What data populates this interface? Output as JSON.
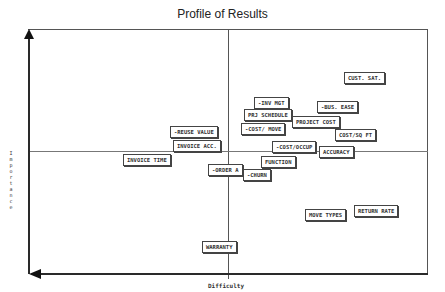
{
  "chart_data": {
    "type": "scatter",
    "title": "Profile of Results",
    "xlabel": "Difficulty",
    "ylabel": "Importance",
    "grid": "quadrant midlines",
    "legend": "none",
    "points": [
      {
        "label": "CUST. SAT.",
        "x": 344,
        "y": 72
      },
      {
        "label": "-INV MGT",
        "x": 254,
        "y": 97
      },
      {
        "label": "-BUS. EASE",
        "x": 317,
        "y": 101
      },
      {
        "label": "PRJ SCHEDULE",
        "x": 244,
        "y": 109
      },
      {
        "label": "PROJECT COST",
        "x": 292,
        "y": 116
      },
      {
        "label": "-COST/ MOVE",
        "x": 241,
        "y": 123
      },
      {
        "label": "COST/SQ FT",
        "x": 335,
        "y": 129
      },
      {
        "label": "-REUSE VALUE",
        "x": 170,
        "y": 126
      },
      {
        "label": "INVOICE ACC.",
        "x": 173,
        "y": 140
      },
      {
        "label": "-COST/OCCUP",
        "x": 272,
        "y": 141
      },
      {
        "label": "ACCURACY",
        "x": 319,
        "y": 146
      },
      {
        "label": "INVOICE TIME",
        "x": 123,
        "y": 154
      },
      {
        "label": "FUNCTION",
        "x": 261,
        "y": 156
      },
      {
        "label": "-ORDER A",
        "x": 208,
        "y": 164
      },
      {
        "label": "-CHURN",
        "x": 243,
        "y": 169
      },
      {
        "label": "MOVE TYPES",
        "x": 305,
        "y": 209
      },
      {
        "label": "RETURN RATE",
        "x": 354,
        "y": 205
      },
      {
        "label": "WARRANTY",
        "x": 202,
        "y": 241
      }
    ]
  }
}
